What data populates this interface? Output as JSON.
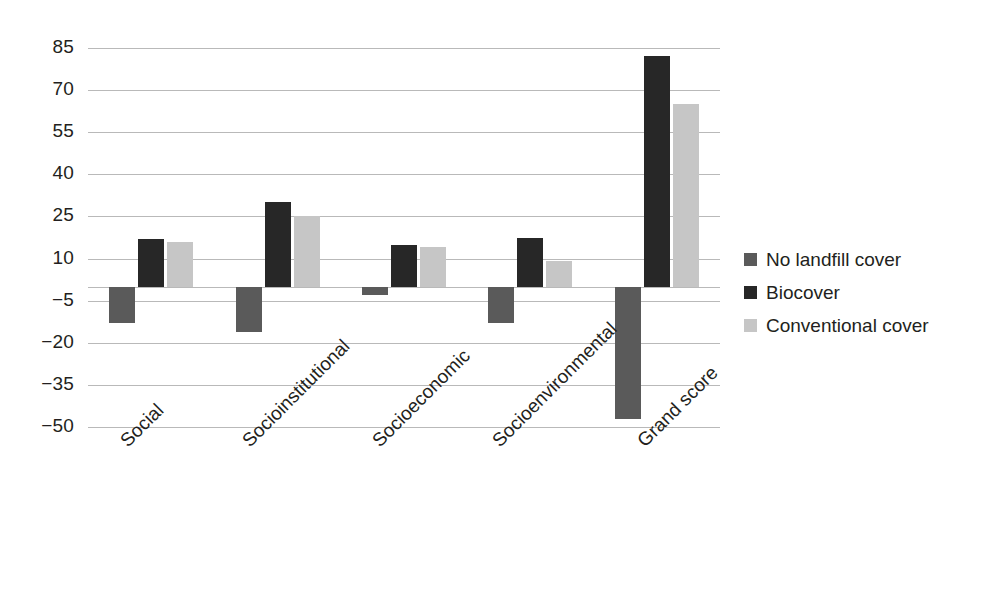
{
  "chart_data": {
    "type": "bar",
    "title": "",
    "subtitle": "",
    "xlabel": "",
    "ylabel": "",
    "categories": [
      "Social",
      "Socioinstitutional",
      "Socioeconomic",
      "Socioenvironmental",
      "Grand score"
    ],
    "series": [
      {
        "name": "No landfill cover",
        "color": "#5a5a5a",
        "values": [
          -13,
          -16,
          -3,
          -13,
          -47
        ]
      },
      {
        "name": "Biocover",
        "color": "#272727",
        "values": [
          17,
          30,
          15,
          17.5,
          82
        ]
      },
      {
        "name": "Conventional cover",
        "color": "#c6c6c6",
        "values": [
          16,
          25,
          14,
          9,
          65
        ]
      }
    ],
    "ylim": [
      -50,
      85
    ],
    "yticks": [
      85,
      70,
      55,
      40,
      25,
      10,
      -5,
      -20,
      -35,
      -50
    ],
    "ytick_labels": [
      "85",
      "70",
      "55",
      "40",
      "25",
      "10",
      "−5",
      "−20",
      "−35",
      "−50"
    ],
    "grid": true,
    "grid_axis": "y",
    "legend_position": "right",
    "background": "#ffffff",
    "gridline_color": "#b9b9b9",
    "text_color": "#231f20",
    "xtick_rotation": -45
  },
  "legend": {
    "items": [
      {
        "label": "No landfill cover"
      },
      {
        "label": "Biocover"
      },
      {
        "label": "Conventional cover"
      }
    ]
  }
}
